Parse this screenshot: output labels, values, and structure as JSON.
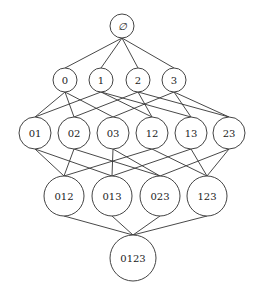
{
  "diagram": {
    "title": "",
    "type": "hasse-diagram",
    "colors": {
      "stroke": "#444444",
      "edge": "#333333",
      "text": "#222222",
      "background": "#ffffff"
    },
    "nodes": [
      {
        "id": "empty",
        "label": "∅",
        "level": 0,
        "x": 122,
        "y": 26,
        "r": 12
      },
      {
        "id": "0",
        "label": "0",
        "level": 1,
        "x": 65,
        "y": 80,
        "r": 12
      },
      {
        "id": "1",
        "label": "1",
        "level": 1,
        "x": 101,
        "y": 80,
        "r": 12
      },
      {
        "id": "2",
        "label": "2",
        "level": 1,
        "x": 138,
        "y": 80,
        "r": 12
      },
      {
        "id": "3",
        "label": "3",
        "level": 1,
        "x": 174,
        "y": 80,
        "r": 12
      },
      {
        "id": "01",
        "label": "01",
        "level": 2,
        "x": 35,
        "y": 133,
        "r": 16
      },
      {
        "id": "02",
        "label": "02",
        "level": 2,
        "x": 74,
        "y": 133,
        "r": 16
      },
      {
        "id": "03",
        "label": "03",
        "level": 2,
        "x": 113,
        "y": 133,
        "r": 16
      },
      {
        "id": "12",
        "label": "12",
        "level": 2,
        "x": 152,
        "y": 133,
        "r": 16
      },
      {
        "id": "13",
        "label": "13",
        "level": 2,
        "x": 191,
        "y": 133,
        "r": 16
      },
      {
        "id": "23",
        "label": "23",
        "level": 2,
        "x": 229,
        "y": 133,
        "r": 16
      },
      {
        "id": "012",
        "label": "012",
        "level": 3,
        "x": 64,
        "y": 196,
        "r": 20
      },
      {
        "id": "013",
        "label": "013",
        "level": 3,
        "x": 112,
        "y": 196,
        "r": 20
      },
      {
        "id": "023",
        "label": "023",
        "level": 3,
        "x": 160,
        "y": 196,
        "r": 20
      },
      {
        "id": "123",
        "label": "123",
        "level": 3,
        "x": 207,
        "y": 196,
        "r": 20
      },
      {
        "id": "0123",
        "label": "0123",
        "level": 4,
        "x": 133,
        "y": 258,
        "r": 23
      }
    ],
    "edges": [
      [
        "empty",
        "0"
      ],
      [
        "empty",
        "1"
      ],
      [
        "empty",
        "2"
      ],
      [
        "empty",
        "3"
      ],
      [
        "0",
        "01"
      ],
      [
        "0",
        "02"
      ],
      [
        "0",
        "03"
      ],
      [
        "1",
        "01"
      ],
      [
        "1",
        "12"
      ],
      [
        "1",
        "13"
      ],
      [
        "2",
        "02"
      ],
      [
        "2",
        "12"
      ],
      [
        "2",
        "23"
      ],
      [
        "3",
        "03"
      ],
      [
        "3",
        "13"
      ],
      [
        "3",
        "23"
      ],
      [
        "01",
        "012"
      ],
      [
        "01",
        "013"
      ],
      [
        "02",
        "012"
      ],
      [
        "02",
        "023"
      ],
      [
        "03",
        "013"
      ],
      [
        "03",
        "023"
      ],
      [
        "12",
        "012"
      ],
      [
        "12",
        "123"
      ],
      [
        "13",
        "013"
      ],
      [
        "13",
        "123"
      ],
      [
        "23",
        "023"
      ],
      [
        "23",
        "123"
      ],
      [
        "012",
        "0123"
      ],
      [
        "013",
        "0123"
      ],
      [
        "023",
        "0123"
      ],
      [
        "123",
        "0123"
      ]
    ]
  }
}
